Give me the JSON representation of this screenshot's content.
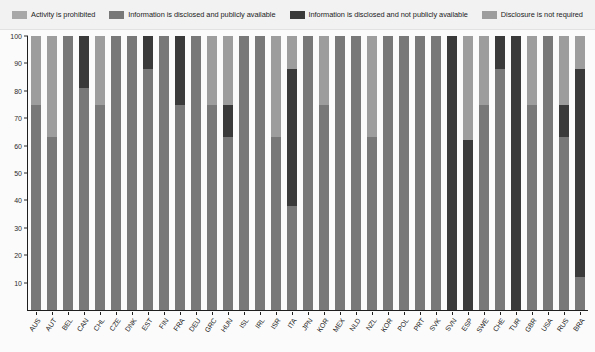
{
  "legend": {
    "items": [
      {
        "label": "Activity is prohibited",
        "color": "#a8a8a8"
      },
      {
        "label": "Information is disclosed and publicly available",
        "color": "#787878"
      },
      {
        "label": "Information is disclosed and not publicly available",
        "color": "#3a3a3a"
      },
      {
        "label": "Disclosure is not required",
        "color": "#9d9d9d"
      }
    ]
  },
  "axes": {
    "y_ticks": [
      0,
      10,
      20,
      30,
      40,
      50,
      60,
      70,
      80,
      90,
      100
    ],
    "y_min": 0,
    "y_max": 100
  },
  "chart_data": {
    "type": "bar",
    "subtype": "stacked-bar-100",
    "title": "",
    "xlabel": "",
    "ylabel": "",
    "ylim": [
      0,
      100
    ],
    "grid": false,
    "legend_position": "top",
    "series": [
      {
        "name": "Activity is prohibited",
        "color": "#a8a8a8"
      },
      {
        "name": "Information is disclosed and publicly available",
        "color": "#787878"
      },
      {
        "name": "Information is disclosed and not publicly available",
        "color": "#3a3a3a"
      },
      {
        "name": "Disclosure is not required",
        "color": "#9d9d9d"
      }
    ],
    "categories": [
      "AUS",
      "AUT",
      "BEL",
      "CAN",
      "CHL",
      "CZE",
      "DNK",
      "EST",
      "FIN",
      "FRA",
      "DEU",
      "GRC",
      "HUN",
      "ISL",
      "IRL",
      "ISR",
      "ITA",
      "JPN",
      "KOR",
      "MEX",
      "NLD",
      "NZL",
      "KOR2",
      "POL",
      "PRT",
      "SVK",
      "SVN",
      "ESP",
      "SWE",
      "CHE",
      "TUR",
      "GBR",
      "USA",
      "RUS",
      "BRA"
    ],
    "category_labels": [
      "AUS",
      "AUT",
      "BEL",
      "CAN",
      "CHL",
      "CZE",
      "DNK",
      "EST",
      "FIN",
      "FRA",
      "DEU",
      "GRC",
      "HUN",
      "ISL",
      "IRL",
      "ISR",
      "ITA",
      "JPN",
      "KOR",
      "MEX",
      "NLD",
      "NZL",
      "KOR",
      "POL",
      "PRT",
      "SVK",
      "SVN",
      "ESP",
      "SWE",
      "CHE",
      "TUR",
      "GBR",
      "USA",
      "RUS",
      "BRA"
    ],
    "stacks": [
      {
        "category": "AUS",
        "prohibited": 0,
        "disclosed_public": 75,
        "disclosed_private": 0,
        "not_required": 25
      },
      {
        "category": "AUT",
        "prohibited": 0,
        "disclosed_public": 63,
        "disclosed_private": 0,
        "not_required": 37
      },
      {
        "category": "BEL",
        "prohibited": 0,
        "disclosed_public": 100,
        "disclosed_private": 0,
        "not_required": 0
      },
      {
        "category": "CAN",
        "prohibited": 0,
        "disclosed_public": 81,
        "disclosed_private": 19,
        "not_required": 0
      },
      {
        "category": "CHL",
        "prohibited": 0,
        "disclosed_public": 75,
        "disclosed_private": 0,
        "not_required": 25
      },
      {
        "category": "CZE",
        "prohibited": 0,
        "disclosed_public": 100,
        "disclosed_private": 0,
        "not_required": 0
      },
      {
        "category": "DNK",
        "prohibited": 0,
        "disclosed_public": 100,
        "disclosed_private": 0,
        "not_required": 0
      },
      {
        "category": "EST",
        "prohibited": 0,
        "disclosed_public": 88,
        "disclosed_private": 12,
        "not_required": 0
      },
      {
        "category": "FIN",
        "prohibited": 0,
        "disclosed_public": 100,
        "disclosed_private": 0,
        "not_required": 0
      },
      {
        "category": "FRA",
        "prohibited": 0,
        "disclosed_public": 75,
        "disclosed_private": 25,
        "not_required": 0
      },
      {
        "category": "DEU",
        "prohibited": 0,
        "disclosed_public": 100,
        "disclosed_private": 0,
        "not_required": 0
      },
      {
        "category": "GRC",
        "prohibited": 0,
        "disclosed_public": 75,
        "disclosed_private": 0,
        "not_required": 25
      },
      {
        "category": "HUN",
        "prohibited": 0,
        "disclosed_public": 63,
        "disclosed_private": 12,
        "not_required": 25
      },
      {
        "category": "ISL",
        "prohibited": 0,
        "disclosed_public": 100,
        "disclosed_private": 0,
        "not_required": 0
      },
      {
        "category": "IRL",
        "prohibited": 0,
        "disclosed_public": 100,
        "disclosed_private": 0,
        "not_required": 0
      },
      {
        "category": "ISR",
        "prohibited": 0,
        "disclosed_public": 63,
        "disclosed_private": 0,
        "not_required": 37
      },
      {
        "category": "ITA",
        "prohibited": 0,
        "disclosed_public": 38,
        "disclosed_private": 50,
        "not_required": 12
      },
      {
        "category": "JPN",
        "prohibited": 0,
        "disclosed_public": 100,
        "disclosed_private": 0,
        "not_required": 0
      },
      {
        "category": "KOR",
        "prohibited": 0,
        "disclosed_public": 75,
        "disclosed_private": 0,
        "not_required": 25
      },
      {
        "category": "MEX",
        "prohibited": 0,
        "disclosed_public": 100,
        "disclosed_private": 0,
        "not_required": 0
      },
      {
        "category": "NLD",
        "prohibited": 0,
        "disclosed_public": 100,
        "disclosed_private": 0,
        "not_required": 0
      },
      {
        "category": "NZL",
        "prohibited": 0,
        "disclosed_public": 63,
        "disclosed_private": 0,
        "not_required": 37
      },
      {
        "category": "NOR",
        "prohibited": 0,
        "disclosed_public": 100,
        "disclosed_private": 0,
        "not_required": 0
      },
      {
        "category": "POL",
        "prohibited": 0,
        "disclosed_public": 100,
        "disclosed_private": 0,
        "not_required": 0
      },
      {
        "category": "PRT",
        "prohibited": 0,
        "disclosed_public": 100,
        "disclosed_private": 0,
        "not_required": 0
      },
      {
        "category": "SVK",
        "prohibited": 0,
        "disclosed_public": 100,
        "disclosed_private": 0,
        "not_required": 0
      },
      {
        "category": "SVN",
        "prohibited": 0,
        "disclosed_public": 0,
        "disclosed_private": 100,
        "not_required": 0
      },
      {
        "category": "ESP",
        "prohibited": 0,
        "disclosed_public": 0,
        "disclosed_private": 62,
        "not_required": 38
      },
      {
        "category": "SWE",
        "prohibited": 0,
        "disclosed_public": 75,
        "disclosed_private": 0,
        "not_required": 25
      },
      {
        "category": "CHE",
        "prohibited": 0,
        "disclosed_public": 88,
        "disclosed_private": 12,
        "not_required": 0
      },
      {
        "category": "TUR",
        "prohibited": 0,
        "disclosed_public": 0,
        "disclosed_private": 100,
        "not_required": 0
      },
      {
        "category": "GBR",
        "prohibited": 0,
        "disclosed_public": 75,
        "disclosed_private": 0,
        "not_required": 25
      },
      {
        "category": "USA",
        "prohibited": 0,
        "disclosed_public": 100,
        "disclosed_private": 0,
        "not_required": 0
      },
      {
        "category": "RUS",
        "prohibited": 0,
        "disclosed_public": 63,
        "disclosed_private": 12,
        "not_required": 25
      },
      {
        "category": "BRA",
        "prohibited": 0,
        "disclosed_public": 12,
        "disclosed_private": 76,
        "not_required": 12
      }
    ]
  }
}
